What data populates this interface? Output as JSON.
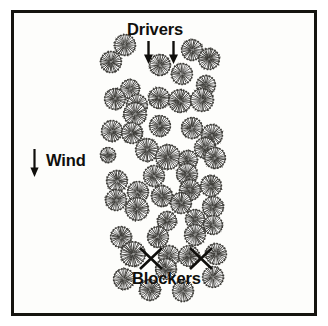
{
  "figure": {
    "title": "",
    "background_color": "#ffffff",
    "frame_color": "#15140f",
    "panel_color": "#fdfdfb",
    "ink_color": "#3b3a36"
  },
  "labels": {
    "drivers": "Drivers",
    "blockers": "Blockers",
    "wind": "Wind"
  },
  "icons": {
    "driver_arrow_1": "down-arrow-icon",
    "driver_arrow_2": "down-arrow-icon",
    "wind_arrow": "down-arrow-icon",
    "blocker_mark_1": "x-mark-icon",
    "blocker_mark_2": "x-mark-icon",
    "shrub": "shrub-icon"
  },
  "chart_data": {
    "type": "scatter",
    "title": "",
    "subtitle": "",
    "xlabel": "",
    "ylabel": "",
    "grid": false,
    "legend_position": "none",
    "xlim": [
      11,
      317
    ],
    "ylim": [
      10,
      316
    ],
    "annotations": [
      {
        "name": "drivers-label",
        "text": "Drivers",
        "x": 160,
        "y": 29,
        "type": "text"
      },
      {
        "name": "blockers-label",
        "text": "Blockers",
        "x": 167,
        "y": 278,
        "type": "text"
      },
      {
        "name": "wind-label",
        "text": "Wind",
        "x": 66,
        "y": 160,
        "type": "text"
      },
      {
        "name": "driver-arrow-left",
        "x": 148,
        "y": 52,
        "type": "down-arrow"
      },
      {
        "name": "driver-arrow-right",
        "x": 173,
        "y": 52,
        "type": "down-arrow"
      },
      {
        "name": "wind-arrow",
        "x": 34,
        "y": 163,
        "type": "down-arrow"
      },
      {
        "name": "blocker-x-left",
        "x": 151,
        "y": 258,
        "type": "x-mark"
      },
      {
        "name": "blocker-x-right",
        "x": 201,
        "y": 258,
        "type": "x-mark"
      }
    ],
    "marker": "shrub",
    "series": [
      {
        "name": "shrubs",
        "points": [
          {
            "x": 125,
            "y": 45,
            "r": 11
          },
          {
            "x": 111,
            "y": 62,
            "r": 11
          },
          {
            "x": 160,
            "y": 65,
            "r": 11
          },
          {
            "x": 192,
            "y": 50,
            "r": 11
          },
          {
            "x": 209,
            "y": 59,
            "r": 11
          },
          {
            "x": 182,
            "y": 74,
            "r": 11
          },
          {
            "x": 130,
            "y": 89,
            "r": 10
          },
          {
            "x": 206,
            "y": 85,
            "r": 10
          },
          {
            "x": 115,
            "y": 99,
            "r": 11
          },
          {
            "x": 137,
            "y": 105,
            "r": 11
          },
          {
            "x": 159,
            "y": 98,
            "r": 11
          },
          {
            "x": 180,
            "y": 101,
            "r": 12
          },
          {
            "x": 202,
            "y": 100,
            "r": 12
          },
          {
            "x": 135,
            "y": 114,
            "r": 12
          },
          {
            "x": 112,
            "y": 131,
            "r": 11
          },
          {
            "x": 132,
            "y": 133,
            "r": 11
          },
          {
            "x": 160,
            "y": 126,
            "r": 11
          },
          {
            "x": 192,
            "y": 128,
            "r": 11
          },
          {
            "x": 212,
            "y": 135,
            "r": 11
          },
          {
            "x": 205,
            "y": 148,
            "r": 11
          },
          {
            "x": 108,
            "y": 155,
            "r": 8
          },
          {
            "x": 147,
            "y": 150,
            "r": 12
          },
          {
            "x": 168,
            "y": 157,
            "r": 13
          },
          {
            "x": 188,
            "y": 160,
            "r": 10
          },
          {
            "x": 215,
            "y": 158,
            "r": 11
          },
          {
            "x": 187,
            "y": 174,
            "r": 11
          },
          {
            "x": 154,
            "y": 176,
            "r": 11
          },
          {
            "x": 117,
            "y": 181,
            "r": 11
          },
          {
            "x": 190,
            "y": 190,
            "r": 11
          },
          {
            "x": 211,
            "y": 186,
            "r": 11
          },
          {
            "x": 138,
            "y": 192,
            "r": 11
          },
          {
            "x": 116,
            "y": 200,
            "r": 11
          },
          {
            "x": 162,
            "y": 196,
            "r": 11
          },
          {
            "x": 181,
            "y": 203,
            "r": 11
          },
          {
            "x": 137,
            "y": 209,
            "r": 12
          },
          {
            "x": 213,
            "y": 207,
            "r": 11
          },
          {
            "x": 195,
            "y": 219,
            "r": 10
          },
          {
            "x": 167,
            "y": 221,
            "r": 10
          },
          {
            "x": 213,
            "y": 225,
            "r": 10
          },
          {
            "x": 121,
            "y": 237,
            "r": 11
          },
          {
            "x": 158,
            "y": 237,
            "r": 11
          },
          {
            "x": 195,
            "y": 235,
            "r": 11
          },
          {
            "x": 133,
            "y": 254,
            "r": 13
          },
          {
            "x": 169,
            "y": 256,
            "r": 11
          },
          {
            "x": 189,
            "y": 256,
            "r": 11
          },
          {
            "x": 216,
            "y": 254,
            "r": 11
          },
          {
            "x": 166,
            "y": 269,
            "r": 11
          },
          {
            "x": 124,
            "y": 279,
            "r": 11
          },
          {
            "x": 213,
            "y": 277,
            "r": 11
          },
          {
            "x": 150,
            "y": 290,
            "r": 11
          },
          {
            "x": 183,
            "y": 291,
            "r": 11
          }
        ]
      }
    ]
  }
}
